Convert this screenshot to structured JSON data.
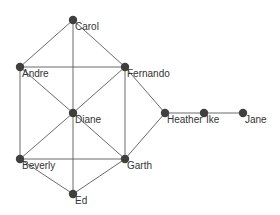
{
  "graph": {
    "type": "network",
    "canvas": {
      "width": 280,
      "height": 215
    },
    "colors": {
      "node": "#3f3f3f",
      "edge": "#5a5a5a",
      "label": "#333333",
      "background": "#ffffff"
    },
    "node_radius": 4.2,
    "nodes": [
      {
        "id": "Andre",
        "label": "Andre",
        "x": 20,
        "y": 67
      },
      {
        "id": "Beverly",
        "label": "Beverly",
        "x": 20,
        "y": 159
      },
      {
        "id": "Carol",
        "label": "Carol",
        "x": 73,
        "y": 20
      },
      {
        "id": "Diane",
        "label": "Diane",
        "x": 73,
        "y": 113
      },
      {
        "id": "Ed",
        "label": "Ed",
        "x": 73,
        "y": 194
      },
      {
        "id": "Fernando",
        "label": "Fernando",
        "x": 125,
        "y": 67
      },
      {
        "id": "Garth",
        "label": "Garth",
        "x": 125,
        "y": 159
      },
      {
        "id": "Heather",
        "label": "Heather",
        "x": 165,
        "y": 113
      },
      {
        "id": "Ike",
        "label": "Ike",
        "x": 204,
        "y": 113
      },
      {
        "id": "Jane",
        "label": "Jane",
        "x": 243,
        "y": 113
      }
    ],
    "edges": [
      [
        "Andre",
        "Carol"
      ],
      [
        "Andre",
        "Fernando"
      ],
      [
        "Andre",
        "Diane"
      ],
      [
        "Andre",
        "Beverly"
      ],
      [
        "Carol",
        "Fernando"
      ],
      [
        "Carol",
        "Diane"
      ],
      [
        "Fernando",
        "Diane"
      ],
      [
        "Fernando",
        "Garth"
      ],
      [
        "Fernando",
        "Heather"
      ],
      [
        "Diane",
        "Beverly"
      ],
      [
        "Diane",
        "Garth"
      ],
      [
        "Diane",
        "Ed"
      ],
      [
        "Beverly",
        "Garth"
      ],
      [
        "Beverly",
        "Ed"
      ],
      [
        "Garth",
        "Ed"
      ],
      [
        "Garth",
        "Heather"
      ],
      [
        "Heather",
        "Ike"
      ],
      [
        "Ike",
        "Jane"
      ]
    ]
  }
}
